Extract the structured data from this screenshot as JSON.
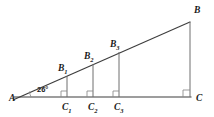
{
  "figure": {
    "background_color": "#ffffff",
    "line_color": "#3d3d3d",
    "vertical_line_color": "#6e6e6e",
    "mark_color": "#8a8a8a",
    "label_color": "#1a1a1a"
  },
  "angle": {
    "label": "26°",
    "vertex": "A",
    "x": 37,
    "y": 92
  },
  "vertices": [
    {
      "name": "vertex-a",
      "label": "A",
      "x": 20,
      "y": 97,
      "label_x": 9,
      "label_y": 101
    },
    {
      "name": "vertex-b",
      "label": "B",
      "x": 190,
      "y": 22,
      "label_x": 194,
      "label_y": 13
    },
    {
      "name": "vertex-c",
      "label": "C",
      "x": 190,
      "y": 97,
      "label_x": 196,
      "label_y": 101
    }
  ],
  "segments": [
    {
      "name": "segment-1",
      "top_label": "B",
      "top_sub": "1",
      "bottom_label": "C",
      "bottom_sub": "1",
      "x": 67,
      "top_y": 76,
      "bottom_y": 97,
      "top_label_x": 58,
      "top_label_y": 71,
      "bottom_label_x": 62,
      "bottom_label_y": 110
    },
    {
      "name": "segment-2",
      "top_label": "B",
      "top_sub": "2",
      "bottom_label": "C",
      "bottom_sub": "2",
      "x": 93,
      "top_y": 64,
      "bottom_y": 97,
      "top_label_x": 84,
      "top_label_y": 59,
      "bottom_label_x": 88,
      "bottom_label_y": 110
    },
    {
      "name": "segment-3",
      "top_label": "B",
      "top_sub": "3",
      "bottom_label": "C",
      "bottom_sub": "3",
      "x": 119,
      "top_y": 52,
      "bottom_y": 97,
      "top_label_x": 110,
      "top_label_y": 47,
      "bottom_label_x": 114,
      "bottom_label_y": 110
    }
  ],
  "right_angle_marks": [
    {
      "name": "right-angle-c1",
      "x": 67,
      "y": 97,
      "size": 6
    },
    {
      "name": "right-angle-c2",
      "x": 93,
      "y": 97,
      "size": 6
    },
    {
      "name": "right-angle-c3",
      "x": 119,
      "y": 97,
      "size": 6
    },
    {
      "name": "right-angle-c",
      "x": 190,
      "y": 97,
      "size": 7
    }
  ],
  "chart_data": {
    "type": "diagram",
    "angle_at_a_degrees": 26,
    "right_angle_at": "C",
    "base_line": {
      "from": "A",
      "to": "C",
      "y": 97
    },
    "hypotenuse": {
      "from": "A",
      "to": "B"
    },
    "parallel_segments": [
      "B1C1",
      "B2C2",
      "B3C3",
      "BC"
    ],
    "points": {
      "A": [
        20,
        97
      ],
      "B": [
        190,
        22
      ],
      "C": [
        190,
        97
      ],
      "B1": [
        67,
        76
      ],
      "C1": [
        67,
        97
      ],
      "B2": [
        93,
        64
      ],
      "C2": [
        93,
        97
      ],
      "B3": [
        119,
        52
      ],
      "C3": [
        119,
        97
      ]
    }
  }
}
